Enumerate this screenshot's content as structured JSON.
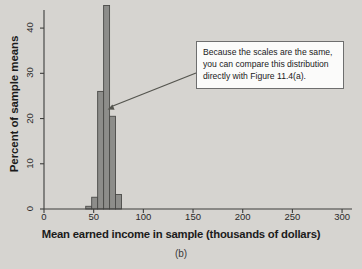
{
  "figure": {
    "panel_caption": "(b)",
    "callout_text": "Because the scales are the same, you can compare this distribution directly with Figure 11.4(a).",
    "colors": {
      "background": "#d6d4d0",
      "bar_fill": "#8d8d8a",
      "bar_stroke": "#4a4a48",
      "axis": "#3d3d3b",
      "callout_bg": "#fbfbfa",
      "callout_border": "#6e6e6e",
      "arrow": "#55554f",
      "text": "#1b1b1b"
    }
  },
  "chart_data": {
    "type": "bar",
    "title": "",
    "subtitle": "",
    "xlabel": "Mean earned income in sample (thousands of dollars)",
    "ylabel": "Percent of sample means",
    "xlim": [
      0,
      310
    ],
    "ylim": [
      0,
      44
    ],
    "xticks": [
      0,
      50,
      100,
      150,
      200,
      250,
      300
    ],
    "xtick_labels": [
      "0",
      "50",
      "100",
      "150",
      "200",
      "250",
      "300"
    ],
    "yticks": [
      0,
      10,
      20,
      30,
      40
    ],
    "ytick_labels": [
      "0",
      "10",
      "20",
      "30",
      "40"
    ],
    "grid": false,
    "legend": null,
    "bin_width": 6,
    "bin_starts": [
      42,
      48,
      54,
      60,
      66,
      72
    ],
    "categories": [
      "42-48",
      "48-54",
      "54-60",
      "60-66",
      "66-72",
      "72-78"
    ],
    "values": [
      0.6,
      2.6,
      26,
      45,
      20.5,
      3.2
    ],
    "annotations": [
      {
        "text": "Because the scales are the same, you can compare this distribution directly with Figure 11.4(a).",
        "points_to_x": 63,
        "points_to_y": 22
      }
    ]
  }
}
